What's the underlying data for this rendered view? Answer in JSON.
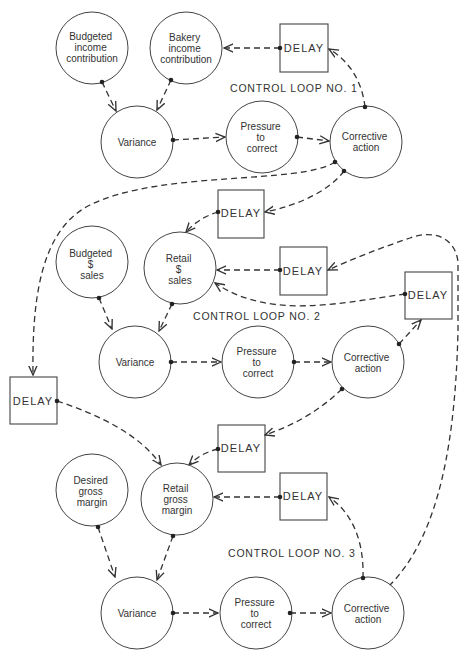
{
  "diagram": {
    "loops": [
      {
        "label": "CONTROL LOOP NO. 1",
        "nodes": {
          "budgeted": [
            "Budgeted",
            "income",
            "contribution"
          ],
          "actual": [
            "Bakery",
            "income",
            "contribution"
          ],
          "variance": [
            "Variance"
          ],
          "pressure": [
            "Pressure",
            "to",
            "correct"
          ],
          "corrective": [
            "Corrective",
            "action"
          ]
        },
        "delay": "DELAY"
      },
      {
        "label": "CONTROL LOOP NO. 2",
        "nodes": {
          "budgeted": [
            "Budgeted",
            "$",
            "sales"
          ],
          "actual": [
            "Retail",
            "$",
            "sales"
          ],
          "variance": [
            "Variance"
          ],
          "pressure": [
            "Pressure",
            "to",
            "correct"
          ],
          "corrective": [
            "Corrective",
            "action"
          ]
        },
        "delay_in": "DELAY",
        "delay": "DELAY",
        "delay_right": "DELAY"
      },
      {
        "label": "CONTROL LOOP NO. 3",
        "nodes": {
          "budgeted": [
            "Desired",
            "gross",
            "margin"
          ],
          "actual": [
            "Retail",
            "gross",
            "margin"
          ],
          "variance": [
            "Variance"
          ],
          "pressure": [
            "Pressure",
            "to",
            "correct"
          ],
          "corrective": [
            "Corrective",
            "action"
          ]
        },
        "delay_in": "DELAY",
        "delay": "DELAY",
        "delay_left": "DELAY"
      }
    ],
    "colors": {
      "line": "#333333",
      "background": "#ffffff"
    }
  }
}
